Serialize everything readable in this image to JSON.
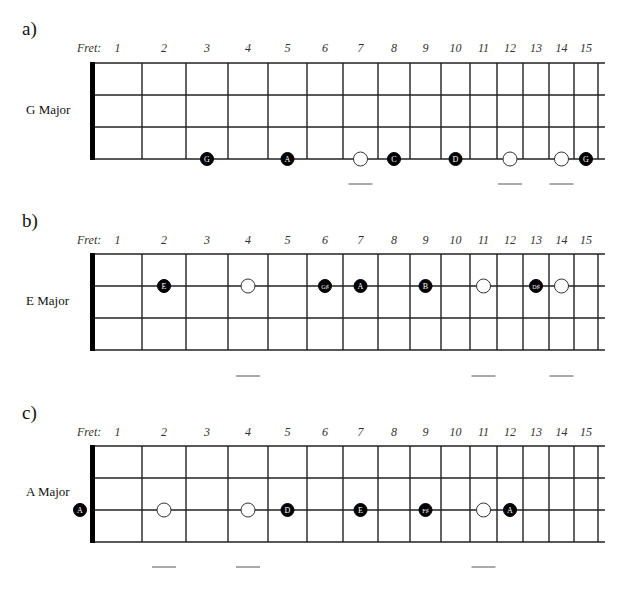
{
  "fret_caption": "Fret:",
  "fret_numbers": [
    "1",
    "2",
    "3",
    "4",
    "5",
    "6",
    "7",
    "8",
    "9",
    "10",
    "11",
    "12",
    "13",
    "14",
    "15"
  ],
  "geometry": {
    "nut_x": 93,
    "fret_x": [
      142,
      186,
      228,
      268,
      307,
      343,
      378,
      410,
      441,
      470,
      497,
      523,
      549,
      574,
      598
    ],
    "string_end_x": 605,
    "string_gap": 32
  },
  "panels": [
    {
      "label": "a)",
      "scale": "G Major",
      "label_y": 18,
      "caption_y": 41,
      "top_y": 63,
      "scale_label_y": 102,
      "dash_y": 184,
      "dash_frets": [
        7,
        12,
        14
      ],
      "notes": [
        {
          "fret": 3,
          "string": 3,
          "name": "G",
          "filled": true
        },
        {
          "fret": 5,
          "string": 3,
          "name": "A",
          "filled": true
        },
        {
          "fret": 7,
          "string": 3,
          "name": "",
          "filled": false
        },
        {
          "fret": 8,
          "string": 3,
          "name": "C",
          "filled": true
        },
        {
          "fret": 10,
          "string": 3,
          "name": "D",
          "filled": true
        },
        {
          "fret": 12,
          "string": 3,
          "name": "",
          "filled": false
        },
        {
          "fret": 14,
          "string": 3,
          "name": "",
          "filled": false
        },
        {
          "fret": 15,
          "string": 3,
          "name": "G",
          "filled": true
        }
      ]
    },
    {
      "label": "b)",
      "scale": "E Major",
      "label_y": 210,
      "caption_y": 233,
      "top_y": 254,
      "scale_label_y": 293,
      "dash_y": 376,
      "dash_frets": [
        4,
        11,
        14
      ],
      "notes": [
        {
          "fret": 2,
          "string": 1,
          "name": "E",
          "filled": true
        },
        {
          "fret": 4,
          "string": 1,
          "name": "",
          "filled": false
        },
        {
          "fret": 6,
          "string": 1,
          "name": "G♯",
          "filled": true
        },
        {
          "fret": 7,
          "string": 1,
          "name": "A",
          "filled": true
        },
        {
          "fret": 9,
          "string": 1,
          "name": "B",
          "filled": true
        },
        {
          "fret": 11,
          "string": 1,
          "name": "",
          "filled": false
        },
        {
          "fret": 13,
          "string": 1,
          "name": "D♯",
          "filled": true
        },
        {
          "fret": 14,
          "string": 1,
          "name": "",
          "filled": false
        }
      ]
    },
    {
      "label": "c)",
      "scale": "A Major",
      "label_y": 402,
      "caption_y": 425,
      "top_y": 446,
      "scale_label_y": 484,
      "dash_y": 567,
      "dash_frets": [
        2,
        4,
        11
      ],
      "notes": [
        {
          "fret": 0,
          "string": 2,
          "name": "A",
          "filled": true
        },
        {
          "fret": 2,
          "string": 2,
          "name": "",
          "filled": false
        },
        {
          "fret": 4,
          "string": 2,
          "name": "",
          "filled": false
        },
        {
          "fret": 5,
          "string": 2,
          "name": "D",
          "filled": true
        },
        {
          "fret": 7,
          "string": 2,
          "name": "E",
          "filled": true
        },
        {
          "fret": 9,
          "string": 2,
          "name": "F♯",
          "filled": true
        },
        {
          "fret": 11,
          "string": 2,
          "name": "",
          "filled": false
        },
        {
          "fret": 12,
          "string": 2,
          "name": "A",
          "filled": true
        }
      ]
    }
  ]
}
